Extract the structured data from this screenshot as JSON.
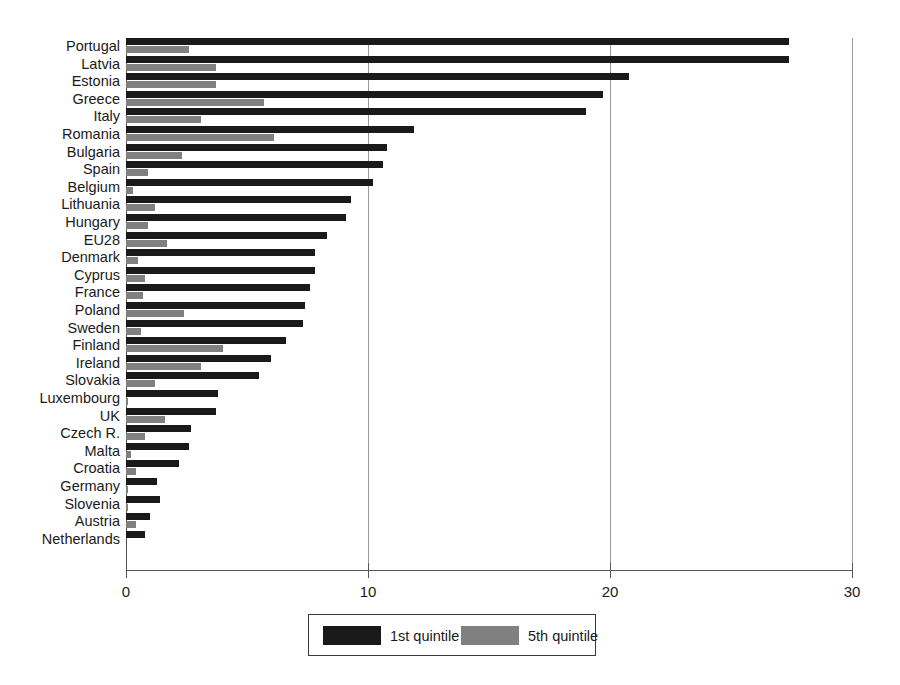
{
  "chart_data": {
    "type": "bar",
    "orientation": "horizontal",
    "title": "",
    "subtitle": "",
    "xlabel": "",
    "ylabel": "",
    "xlim": [
      0,
      30
    ],
    "xticks": [
      0,
      10,
      20,
      30
    ],
    "xtick_labels": [
      "0",
      "10",
      "20",
      "30"
    ],
    "grid": true,
    "grid_axis": "x",
    "legend_position": "bottom",
    "categories": [
      "Portugal",
      "Latvia",
      "Estonia",
      "Greece",
      "Italy",
      "Romania",
      "Bulgaria",
      "Spain",
      "Belgium",
      "Lithuania",
      "Hungary",
      "EU28",
      "Denmark",
      "Cyprus",
      "France",
      "Poland",
      "Sweden",
      "Finland",
      "Ireland",
      "Slovakia",
      "Luxembourg",
      "UK",
      "Czech R.",
      "Malta",
      "Croatia",
      "Germany",
      "Slovenia",
      "Austria",
      "Netherlands"
    ],
    "series": [
      {
        "name": "1st quintile",
        "color": "#1a1a1a",
        "values": [
          27.4,
          27.4,
          20.8,
          19.7,
          19.0,
          11.9,
          10.8,
          10.6,
          10.2,
          9.3,
          9.1,
          8.3,
          7.8,
          7.8,
          7.6,
          7.4,
          7.3,
          6.6,
          6.0,
          5.5,
          3.8,
          3.7,
          2.7,
          2.6,
          2.2,
          1.3,
          1.4,
          1.0,
          0.8
        ]
      },
      {
        "name": "5th quintile",
        "color": "#808080",
        "values": [
          2.6,
          3.7,
          3.7,
          5.7,
          3.1,
          6.1,
          2.3,
          0.9,
          0.3,
          1.2,
          0.9,
          1.7,
          0.5,
          0.8,
          0.7,
          2.4,
          0.6,
          4.0,
          3.1,
          1.2,
          0.1,
          1.6,
          0.8,
          0.2,
          0.4,
          0.1,
          0.1,
          0.4,
          0.0
        ]
      }
    ]
  },
  "legend": {
    "entries": [
      {
        "label": "1st quintile",
        "color": "#1a1a1a"
      },
      {
        "label": "5th quintile",
        "color": "#808080"
      }
    ]
  },
  "axis": {
    "tick_labels": [
      "0",
      "10",
      "20",
      "30"
    ],
    "tick_values": [
      0,
      10,
      20,
      30
    ]
  }
}
